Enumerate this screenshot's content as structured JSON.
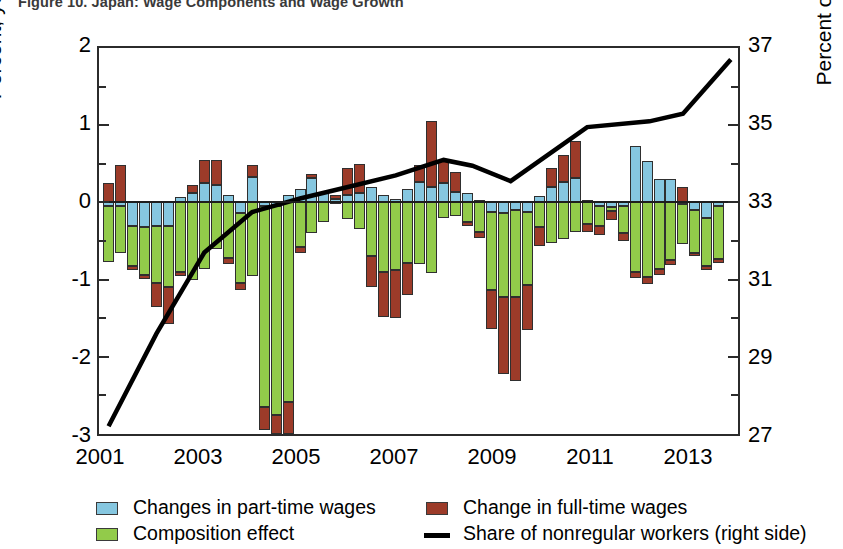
{
  "title": "Figure 10. Japan: Wage Components and Wage Growth",
  "axes": {
    "left_label": "Percent; year over year",
    "right_label": "Percent of staff",
    "left_ticks": [
      "2",
      "1",
      "0",
      "-1",
      "-2",
      "-3"
    ],
    "right_ticks": [
      "37",
      "35",
      "33",
      "31",
      "29",
      "27"
    ],
    "x_ticks": [
      "2001",
      "2003",
      "2005",
      "2007",
      "2009",
      "2011",
      "2013"
    ]
  },
  "legend": {
    "items": [
      {
        "label": "Changes in part-time wages",
        "type": "swatch",
        "color": "#86C7E0"
      },
      {
        "label": "Change in full-time wages",
        "type": "swatch",
        "color": "#9C3B29"
      },
      {
        "label": "Composition effect",
        "type": "swatch",
        "color": "#92CB4A"
      },
      {
        "label": "Share of nonregular workers (right side)",
        "type": "line",
        "color": "#000000"
      }
    ]
  },
  "colors": {
    "part_time": "#86C7E0",
    "full_time": "#9C3B29",
    "composition": "#92CB4A",
    "share_line": "#000000",
    "axis": "#2b2b2b"
  },
  "chart_data": {
    "type": "bar",
    "title": "Japan: Wage Components and Wage Growth",
    "xlabel": "",
    "ylabel": "Percent; year over year",
    "ylabel_right": "Percent of staff",
    "ylim": [
      -3,
      2
    ],
    "ylim_right": [
      27,
      37
    ],
    "grid": false,
    "legend_position": "bottom",
    "stacked": true,
    "x_tick_labels": [
      "2001",
      "2003",
      "2005",
      "2007",
      "2009",
      "2011",
      "2013"
    ],
    "x_tick_values": [
      2001,
      2003,
      2005,
      2007,
      2009,
      2011,
      2013
    ],
    "x": [
      2001.0,
      2001.25,
      2001.5,
      2001.75,
      2002.0,
      2002.25,
      2002.5,
      2002.75,
      2003.0,
      2003.25,
      2003.5,
      2003.75,
      2004.0,
      2004.25,
      2004.5,
      2004.75,
      2005.0,
      2005.25,
      2005.5,
      2005.75,
      2006.0,
      2006.25,
      2006.5,
      2006.75,
      2007.0,
      2007.25,
      2007.5,
      2007.75,
      2008.0,
      2008.25,
      2008.5,
      2008.75,
      2009.0,
      2009.25,
      2009.5,
      2009.75,
      2010.0,
      2010.25,
      2010.5,
      2010.75,
      2011.0,
      2011.25,
      2011.5,
      2011.75,
      2012.0,
      2012.25,
      2012.5,
      2012.75,
      2013.0,
      2013.25,
      2013.5,
      2013.75
    ],
    "series": [
      {
        "name": "Changes in part-time wages",
        "color": "#86C7E0",
        "values": [
          -0.05,
          -0.05,
          -0.3,
          -0.32,
          -0.3,
          -0.3,
          0.07,
          0.12,
          0.25,
          0.22,
          0.1,
          -0.14,
          0.33,
          -0.05,
          -0.05,
          0.1,
          0.18,
          0.32,
          0.12,
          0.05,
          0.1,
          0.12,
          0.2,
          0.1,
          0.05,
          0.18,
          0.26,
          0.2,
          0.25,
          0.13,
          0.12,
          0.03,
          -0.12,
          -0.14,
          -0.1,
          -0.12,
          0.08,
          0.2,
          0.27,
          0.32,
          0.03,
          -0.05,
          -0.06,
          -0.05,
          0.73,
          0.53,
          0.3,
          0.3,
          -0.02,
          -0.1,
          -0.2,
          -0.05
        ]
      },
      {
        "name": "Composition effect",
        "color": "#92CB4A",
        "values": [
          -0.72,
          -0.6,
          -0.52,
          -0.62,
          -0.75,
          -0.8,
          -0.9,
          -1.0,
          -0.86,
          -0.6,
          -0.72,
          -0.9,
          -0.95,
          -2.6,
          -2.7,
          -2.58,
          -0.58,
          -0.4,
          -0.25,
          -0.02,
          -0.22,
          -0.35,
          -0.7,
          -0.9,
          -0.88,
          -0.78,
          -0.8,
          -0.92,
          -0.2,
          -0.18,
          -0.25,
          -0.38,
          -1.02,
          -1.08,
          -1.12,
          -0.95,
          -0.32,
          -0.52,
          -0.48,
          -0.38,
          -0.28,
          -0.25,
          -0.05,
          -0.35,
          -0.9,
          -0.96,
          -0.86,
          -0.75,
          -0.52,
          -0.55,
          -0.62,
          -0.68
        ]
      },
      {
        "name": "Change in full-time wages",
        "color": "#9C3B29",
        "values": [
          0.25,
          0.48,
          -0.05,
          -0.05,
          -0.3,
          -0.48,
          -0.05,
          0.1,
          0.3,
          0.33,
          -0.08,
          -0.1,
          0.16,
          -0.3,
          -0.25,
          -0.42,
          -0.08,
          0.05,
          0.02,
          0.05,
          0.35,
          0.38,
          -0.4,
          -0.58,
          -0.62,
          -0.42,
          0.22,
          0.85,
          0.3,
          0.27,
          -0.05,
          -0.08,
          -0.5,
          -1.0,
          -1.1,
          -0.58,
          -0.25,
          0.25,
          0.35,
          0.48,
          -0.1,
          -0.12,
          -0.12,
          -0.1,
          -0.08,
          -0.1,
          -0.08,
          -0.06,
          0.2,
          -0.05,
          -0.05,
          -0.05
        ]
      }
    ],
    "line_series": {
      "name": "Share of nonregular workers (right side)",
      "color": "#000000",
      "axis": "right",
      "x": [
        2001.0,
        2002.0,
        2003.0,
        2004.0,
        2005.0,
        2006.0,
        2007.0,
        2008.0,
        2008.6,
        2009.4,
        2011.0,
        2012.3,
        2013.0,
        2014.0
      ],
      "values": [
        27.2,
        29.6,
        31.7,
        32.75,
        33.1,
        33.4,
        33.7,
        34.1,
        33.95,
        33.55,
        34.95,
        35.1,
        35.3,
        36.7
      ]
    }
  }
}
